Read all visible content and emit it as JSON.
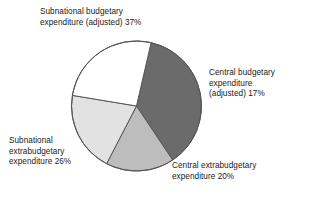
{
  "chart_data": {
    "type": "pie",
    "title": "",
    "subtitle": "",
    "xlabel": "",
    "ylabel": "",
    "grid": false,
    "legend_position": "none",
    "labels_position": "outside-callout",
    "total_percent": 100,
    "start_angle_deg": -77,
    "direction": "clockwise",
    "categories": [
      "Subnational budgetary expenditure (adjusted)",
      "Central budgetary expenditure (adjusted)",
      "Central extrabudgetary expenditure",
      "Subnational extrabudgetary expenditure"
    ],
    "values": [
      37,
      17,
      20,
      26
    ],
    "colors": [
      "#6b6b6b",
      "#bdbdbd",
      "#e2e2e2",
      "#ffffff"
    ],
    "slices": [
      {
        "name": "subnational-budgetary",
        "label": "Subnational budgetary\nexpenditure (adjusted) 37%",
        "value": 37,
        "unit": "%",
        "color": "#6b6b6b",
        "position": "upper-left"
      },
      {
        "name": "central-budgetary",
        "label": "Central budgetary\nexpenditure\n(adjusted) 17%",
        "value": 17,
        "unit": "%",
        "color": "#bdbdbd",
        "position": "upper-right"
      },
      {
        "name": "central-extrabudgetary",
        "label": "Central extrabudgetary\nexpenditure 20%",
        "value": 20,
        "unit": "%",
        "color": "#e2e2e2",
        "position": "lower-right"
      },
      {
        "name": "subnational-extrabudgetary",
        "label": "Subnational\nextrabudgetary\nexpenditure 26%",
        "value": 26,
        "unit": "%",
        "color": "#ffffff",
        "position": "lower-left"
      }
    ]
  },
  "figure": {
    "stroke_color": "#555555",
    "background": "#ffffff",
    "center_x": 136.5,
    "center_y": 106,
    "radius": 65
  }
}
